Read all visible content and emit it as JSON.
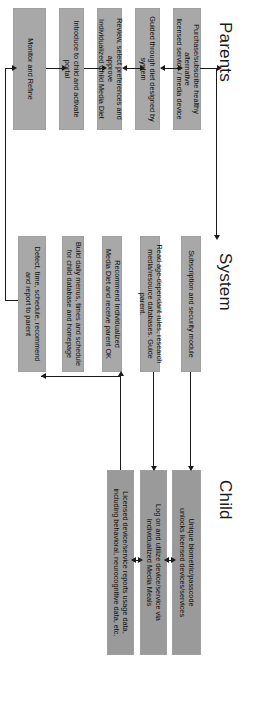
{
  "diagram": {
    "type": "swimlane-flowchart",
    "orientation": "rotated-90-clockwise",
    "colors": {
      "box_fill": "#a8a8a8",
      "box_fill_dark": "#9a9a9a",
      "line": "#1a1a1a",
      "background": "#ffffff",
      "text": "#0d0d0d"
    },
    "lanes": [
      {
        "id": "parents",
        "label": "Parents"
      },
      {
        "id": "system",
        "label": "System"
      },
      {
        "id": "child",
        "label": "Child"
      }
    ],
    "nodes": {
      "parents": [
        {
          "id": "p1",
          "line1": "Purchase/subscribe healthy alternative",
          "line2": "licensed service / media device"
        },
        {
          "id": "p2",
          "line1": "Guided through diet designed by system",
          "line2": ""
        },
        {
          "id": "p3",
          "line1": "Review, select preferences and approve",
          "line2": "Individualized Child Media Diet"
        },
        {
          "id": "p4",
          "line1": "Introduce to child and activate portal",
          "line2": ""
        },
        {
          "id": "p5",
          "line1": "Monitor and Refine",
          "line2": ""
        }
      ],
      "system": [
        {
          "id": "s1",
          "line1": "Subscription and security module",
          "line2": ""
        },
        {
          "id": "s2",
          "line1": "Read age-dependant rules, research",
          "line2": "media/resource databases. Guide parent."
        },
        {
          "id": "s3",
          "line1": "Recommend Individualized",
          "line2": "Media Diet and receive parent OK"
        },
        {
          "id": "s4",
          "line1": "Build daily menus, times and schedule",
          "line2": "for child database and homepage"
        },
        {
          "id": "s5",
          "line1": "Detect, time, schedule, recommend",
          "line2": "and report to parent"
        }
      ],
      "child": [
        {
          "id": "c1",
          "line1": "Unique biometric/passcode",
          "line2": "unlocks licensed devices/services"
        },
        {
          "id": "c2",
          "line1": "Log on and utilize device/service via",
          "line2": "Individualized Media Meals"
        },
        {
          "id": "c3",
          "line1": "Licensed device/service reports usage data,",
          "line2": "including behavioral, neurocognitive data, etc."
        }
      ]
    }
  }
}
